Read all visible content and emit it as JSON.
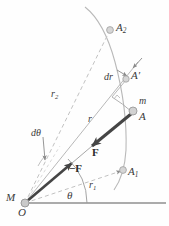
{
  "figure": {
    "colors": {
      "curve": "#b9b9b9",
      "dashed": "#c2c2c2",
      "solid_thin": "#a8a8a8",
      "vector": "#4a4a4a",
      "baseline": "#999999",
      "point_fill": "#d6d6d6",
      "point_stroke": "#a0a0a0",
      "text": "#3a3a3a"
    }
  },
  "labels": {
    "a2": {
      "text": "A",
      "sub": "2",
      "x": 116,
      "y": 22
    },
    "a1": {
      "text": "A",
      "sub": "1",
      "x": 128,
      "y": 166
    },
    "a_prime": {
      "text": "A",
      "prime": "′",
      "x": 131,
      "y": 70
    },
    "a_point": {
      "text": "A",
      "x": 139,
      "y": 111
    },
    "mass_m": {
      "text": "m",
      "x": 139,
      "y": 96
    },
    "dr": {
      "text": "dr",
      "x": 104,
      "y": 72
    },
    "r": {
      "text": "r",
      "x": 88,
      "y": 114
    },
    "r1": {
      "text": "r",
      "sub": "1",
      "x": 89,
      "y": 180
    },
    "r2": {
      "text": "r",
      "sub": "2",
      "x": 51,
      "y": 89
    },
    "dtheta": {
      "text": "dθ",
      "x": 31,
      "y": 128
    },
    "theta": {
      "text": "θ",
      "x": 67,
      "y": 190
    },
    "force_f": {
      "text": "F",
      "x": 92,
      "y": 147
    },
    "force_minus_f": {
      "text": "−F",
      "x": 69,
      "y": 163
    },
    "mass_M": {
      "text": "M",
      "x": 6,
      "y": 192
    },
    "origin_O": {
      "text": "O",
      "x": 18,
      "y": 207
    }
  },
  "geometry": {
    "origin": {
      "x": 25,
      "y": 203
    },
    "point_A": {
      "x": 134,
      "y": 111
    },
    "point_A1": {
      "x": 123,
      "y": 170
    },
    "point_A2": {
      "x": 110,
      "y": 30
    },
    "point_Aprime": {
      "x": 126,
      "y": 79
    },
    "baseline_end": {
      "x": 166,
      "y": 203
    }
  }
}
